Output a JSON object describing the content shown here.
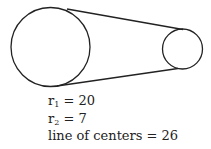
{
  "diagram": {
    "type": "two circles connected by external tangent lines (belt)",
    "stroke_color": "#222222",
    "large_circle": {
      "cx": 50.5,
      "cy": 47,
      "r": 39.5
    },
    "small_circle": {
      "cx": 182.5,
      "cy": 49,
      "r": 20
    },
    "top_tangent": {
      "x1": 67,
      "y1": 9,
      "x2": 183,
      "y2": 29.5
    },
    "bottom_tangent": {
      "x1": 57,
      "y1": 86,
      "x2": 178,
      "y2": 68.5
    }
  },
  "labels": {
    "r1": {
      "var": "r",
      "sub": "1",
      "eq": " = 20"
    },
    "r2": {
      "var": "r",
      "sub": "2",
      "eq": " = 7"
    },
    "centers": {
      "text": "line of centers = 26"
    }
  }
}
